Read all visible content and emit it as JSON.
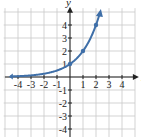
{
  "chart_data": {
    "type": "line",
    "title": "",
    "function": "y = 2^x",
    "xlabel": "x",
    "ylabel": "y",
    "xlim": [
      -5,
      5
    ],
    "ylim": [
      -5,
      5
    ],
    "grid": true,
    "x_ticks": [
      "-4",
      "-3",
      "-2",
      "-1",
      "1",
      "2",
      "3",
      "4"
    ],
    "y_ticks": [
      "4",
      "3",
      "2",
      "1",
      "-1",
      "-2",
      "-3",
      "-4"
    ],
    "points": [
      {
        "x": 0,
        "y": 1
      },
      {
        "x": 1,
        "y": 2
      },
      {
        "x": 2,
        "y": 4
      }
    ],
    "series": [
      {
        "name": "2^x",
        "color": "#3f6fa8"
      }
    ]
  },
  "labels": {
    "x": "x",
    "y": "y"
  },
  "colors": {
    "curve": "#3f6fa8",
    "grid": "#c8c8c8",
    "axis": "#222222"
  }
}
